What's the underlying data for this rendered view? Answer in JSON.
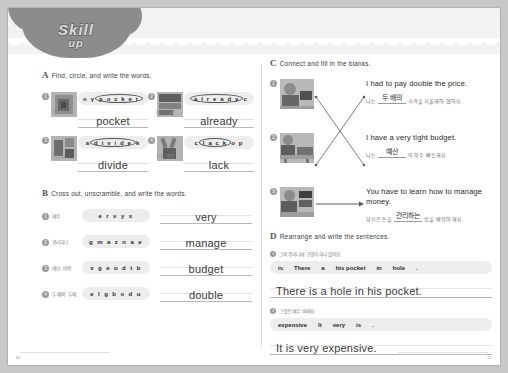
{
  "logo": {
    "line1": "Skill",
    "line2": "up"
  },
  "sections": {
    "A": {
      "letter": "A",
      "title": "Find, circle, and write the words.",
      "items": [
        {
          "num": "1",
          "puzzle_pre": "o y",
          "puzzle_circled": "p o c k e t",
          "puzzle_post": "",
          "answer": "pocket",
          "korean": "주머니"
        },
        {
          "num": "2",
          "puzzle_pre": "",
          "puzzle_circled": "a l r e a d y",
          "puzzle_post": "c",
          "answer": "already",
          "korean": "이미, 벌써"
        },
        {
          "num": "3",
          "puzzle_pre": "a",
          "puzzle_circled": "d i v i d e",
          "puzzle_post": "k",
          "answer": "divide",
          "korean": "나누다"
        },
        {
          "num": "4",
          "puzzle_pre": "c",
          "puzzle_circled": "l a c k",
          "puzzle_post": "o p",
          "answer": "lack",
          "korean": "부족, 결핍"
        }
      ]
    },
    "B": {
      "letter": "B",
      "title": "Cross out, unscramble, and write the words.",
      "items": [
        {
          "num": "1",
          "korean": "매우",
          "scrambled": "e r v y x",
          "answer": "very"
        },
        {
          "num": "2",
          "korean": "관리하다",
          "scrambled": "g m a z n a e",
          "answer": "manage"
        },
        {
          "num": "3",
          "korean": "예산, 비용",
          "scrambled": "x g e u d t b",
          "answer": "budget"
        },
        {
          "num": "4",
          "korean": "두 배의, 두배",
          "scrambled": "e l g b o d u",
          "answer": "double"
        }
      ]
    },
    "C": {
      "letter": "C",
      "title": "Connect and fill in the blanks.",
      "items": [
        {
          "num": "1",
          "english": "I had to pay double the price.",
          "ko_pre": "나는",
          "ko_blank": "두 배의",
          "ko_post": "가격을 지불해야 했어요."
        },
        {
          "num": "2",
          "english": "I have a very tight budget.",
          "ko_pre": "나는",
          "ko_blank": "예산",
          "ko_post": "이 아주 빠듯해요."
        },
        {
          "num": "3",
          "english": "You have to learn how to manage money.",
          "ko_pre": "당신은 돈을",
          "ko_blank": "관리하는",
          "ko_post": "법을 배워야 해요."
        }
      ]
    },
    "D": {
      "letter": "D",
      "title": "Rearrange and write the sentences.",
      "items": [
        {
          "num": "1",
          "korean": "그의 주머니에 구멍이 하나 있어요.",
          "tiles": [
            "is",
            "There",
            "a",
            "his pocket",
            "in",
            "hole",
            "."
          ],
          "answer": "There is a hole in his pocket."
        },
        {
          "num": "2",
          "korean": "그것은 매우 비싸요.",
          "tiles": [
            "expensive",
            "It",
            "very",
            "is",
            "."
          ],
          "answer": "It is very expensive."
        }
      ]
    }
  },
  "footer": {
    "page_left": "60",
    "page_right": "61"
  }
}
